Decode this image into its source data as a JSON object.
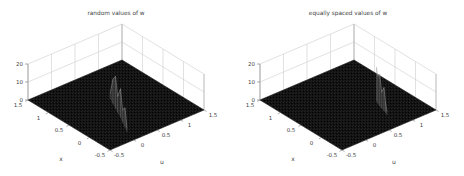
{
  "figure": {
    "background": "#ffffff",
    "style": "MATLAB 3D mesh figure, grayscale scan look"
  },
  "colors": {
    "background": "#ffffff",
    "surface_fill": "#131313",
    "surface_speckle_light": "#3a3a3a",
    "surface_speckle_dark": "#000000",
    "grid_line": "#cccccc",
    "wall_edge": "#b5b5b5",
    "axis_line": "#8a8a8a",
    "tick_mark": "#777777",
    "text": "#454545",
    "ridge_fill": "rgba(160,160,160,0.20)",
    "ridge_line": "#a8a8a8",
    "ridge_spike": "#8a8a8a"
  },
  "chart_data": [
    {
      "name": "plot-random-values",
      "type": "surface-3d-mesh",
      "title": "random values of w",
      "xlabel": "x",
      "ylabel": "u",
      "x_range": [
        -0.5,
        1.5
      ],
      "y_range": [
        -0.5,
        1.5
      ],
      "z_range": [
        0,
        20
      ],
      "x_ticks": [
        "1.5",
        "1",
        "0.5",
        "0",
        "-0.5"
      ],
      "y_ticks": [
        "-0.5",
        "0",
        "0.5",
        "1",
        "1.5"
      ],
      "z_ticks": [
        "0",
        "10",
        "20"
      ],
      "grid": true,
      "surface": "flat near-zero black mesh over the whole square domain",
      "ridge_points": [
        [
          0.7,
          0.55,
          3
        ],
        [
          0.55,
          0.48,
          14
        ],
        [
          0.42,
          0.42,
          18
        ],
        [
          0.3,
          0.36,
          9
        ],
        [
          0.16,
          0.3,
          16
        ],
        [
          0.02,
          0.22,
          7
        ],
        [
          -0.12,
          0.15,
          11
        ],
        [
          -0.25,
          0.08,
          2
        ]
      ]
    },
    {
      "name": "plot-equally-spaced-values",
      "type": "surface-3d-mesh",
      "title": "equally spaced values of w",
      "xlabel": "x",
      "ylabel": "u",
      "x_range": [
        -0.5,
        1.5
      ],
      "y_range": [
        -0.5,
        1.5
      ],
      "z_range": [
        0,
        20
      ],
      "x_ticks": [
        "1.5",
        "1",
        "0.5",
        "0",
        "-0.5"
      ],
      "y_ticks": [
        "-0.5",
        "0",
        "0.5",
        "1",
        "1.5"
      ],
      "z_ticks": [
        "0",
        "10",
        "20"
      ],
      "grid": true,
      "surface": "flat near-zero black mesh over the whole square domain",
      "ridge_points": [
        [
          0.3,
          0.93,
          19
        ],
        [
          0.23,
          0.9,
          15
        ],
        [
          0.15,
          0.87,
          18
        ],
        [
          0.08,
          0.85,
          9
        ],
        [
          0.0,
          0.83,
          13
        ],
        [
          -0.06,
          0.81,
          6
        ],
        [
          -0.13,
          0.78,
          2
        ]
      ]
    }
  ]
}
